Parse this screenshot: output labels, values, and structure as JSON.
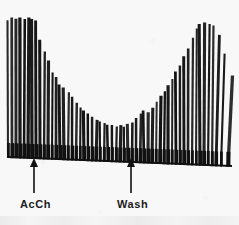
{
  "figure": {
    "background_color": "#f8f8f9",
    "ink_color": "#111111",
    "width": 239,
    "height": 225
  },
  "annotations": {
    "acch": {
      "label": "AcCh",
      "arrow_x": 34,
      "arrow_tip_y": 158,
      "arrow_tail_y": 193
    },
    "wash": {
      "label": "Wash",
      "arrow_x": 131,
      "arrow_tip_y": 158,
      "arrow_tail_y": 193
    }
  },
  "chart_data": {
    "type": "line",
    "title": "",
    "subtitle": "",
    "xlabel": "",
    "ylabel": "",
    "grid": false,
    "legend": null,
    "baseline": {
      "y_left": 157,
      "y_right": 166,
      "note": "Baseline drifts slightly downward from left to right."
    },
    "x_range": [
      8,
      232
    ],
    "y_range_pixels": [
      10,
      166
    ],
    "events": [
      {
        "name": "AcCh",
        "x": 34,
        "spike_index": 7
      },
      {
        "name": "Wash",
        "x": 131,
        "spike_index": 31
      }
    ],
    "series": [
      {
        "name": "contraction amplitude",
        "units": "relative",
        "spike_count": 55,
        "x": [
          8,
          12,
          16,
          20,
          24,
          28,
          32,
          36,
          40,
          44,
          48,
          52,
          56,
          60,
          64,
          68,
          72,
          76,
          80,
          84,
          88,
          92,
          96,
          100,
          104,
          108,
          112,
          116,
          120,
          124,
          128,
          132,
          136,
          140,
          144,
          148,
          152,
          156,
          160,
          164,
          168,
          172,
          176,
          180,
          184,
          188,
          192,
          196,
          200,
          204,
          208,
          212,
          216,
          221,
          228
        ],
        "values": [
          0.93,
          0.95,
          0.94,
          0.95,
          0.94,
          0.95,
          0.94,
          0.93,
          0.8,
          0.72,
          0.66,
          0.58,
          0.55,
          0.5,
          0.48,
          0.45,
          0.42,
          0.38,
          0.35,
          0.33,
          0.31,
          0.29,
          0.27,
          0.26,
          0.25,
          0.24,
          0.24,
          0.23,
          0.24,
          0.23,
          0.25,
          0.26,
          0.29,
          0.32,
          0.34,
          0.33,
          0.36,
          0.4,
          0.44,
          0.47,
          0.51,
          0.55,
          0.6,
          0.64,
          0.7,
          0.75,
          0.82,
          0.88,
          0.91,
          0.92,
          0.91,
          0.9,
          0.84,
          0.72,
          0.58
        ]
      }
    ]
  }
}
